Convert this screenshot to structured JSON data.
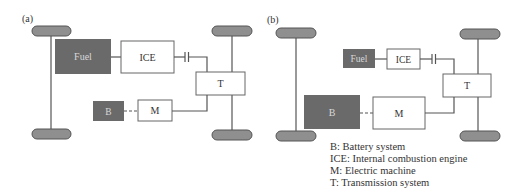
{
  "colors": {
    "dark_box": "#6a6a6a",
    "wheel_fill": "#8f8f8f",
    "line": "#555555",
    "box_border": "#666666",
    "light_text": "#d8d8d8",
    "dark_text": "#333333"
  },
  "panel_a": {
    "label": "(a)",
    "blocks": {
      "fuel": "Fuel",
      "ice": "ICE",
      "transmission": "T",
      "battery": "B",
      "motor": "M"
    }
  },
  "panel_b": {
    "label": "(b)",
    "blocks": {
      "fuel": "Fuel",
      "ice": "ICE",
      "transmission": "T",
      "battery": "B",
      "motor": "M"
    }
  },
  "legend": [
    "B: Battery system",
    "ICE: Internal combustion engine",
    "M: Electric machine",
    "T: Transmission system"
  ]
}
